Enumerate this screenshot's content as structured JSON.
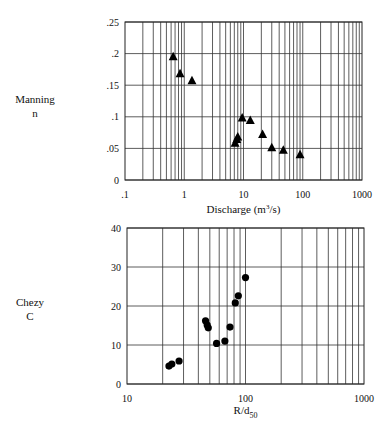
{
  "chart_data": [
    {
      "type": "scatter",
      "title": "",
      "ylabel": "Manning n",
      "ylabel_lines": [
        "Manning",
        "n"
      ],
      "xlabel": "Discharge (m³/s)",
      "xlabel_main": "Discharge (m",
      "xlabel_sup": "3",
      "xlabel_tail": "/s)",
      "xscale": "log",
      "xlim": [
        0.1,
        1000
      ],
      "ylim": [
        0,
        0.25
      ],
      "xticks": [
        ".1",
        "1",
        "10",
        "100",
        "1000"
      ],
      "xtick_values": [
        0.1,
        1,
        10,
        100,
        1000
      ],
      "yticks": [
        "0",
        ".05",
        ".1",
        ".15",
        ".2",
        ".25"
      ],
      "ytick_values": [
        0,
        0.05,
        0.1,
        0.15,
        0.2,
        0.25
      ],
      "grid": true,
      "marker": "triangle",
      "points": [
        {
          "x": 0.65,
          "y": 0.195
        },
        {
          "x": 0.85,
          "y": 0.168
        },
        {
          "x": 1.35,
          "y": 0.157
        },
        {
          "x": 7.2,
          "y": 0.058
        },
        {
          "x": 7.7,
          "y": 0.064
        },
        {
          "x": 8.0,
          "y": 0.068
        },
        {
          "x": 9.5,
          "y": 0.098
        },
        {
          "x": 13,
          "y": 0.094
        },
        {
          "x": 21,
          "y": 0.072
        },
        {
          "x": 30,
          "y": 0.051
        },
        {
          "x": 47,
          "y": 0.047
        },
        {
          "x": 90,
          "y": 0.04
        }
      ]
    },
    {
      "type": "scatter",
      "title": "",
      "ylabel": "Chezy C",
      "ylabel_lines": [
        "Chezy",
        "C"
      ],
      "xlabel": "R/d50",
      "xlabel_main": "R/d",
      "xlabel_sub": "50",
      "xscale": "log",
      "xlim": [
        10,
        1000
      ],
      "ylim": [
        0,
        40
      ],
      "xticks": [
        "10",
        "100",
        "1000"
      ],
      "xtick_values": [
        10,
        100,
        1000
      ],
      "yticks": [
        "0",
        "10",
        "20",
        "30",
        "40"
      ],
      "ytick_values": [
        0,
        10,
        20,
        30,
        40
      ],
      "grid": true,
      "marker": "circle",
      "points": [
        {
          "x": 22.6,
          "y": 4.6
        },
        {
          "x": 23.9,
          "y": 5.1
        },
        {
          "x": 27.5,
          "y": 5.9
        },
        {
          "x": 46,
          "y": 16.2
        },
        {
          "x": 47.5,
          "y": 15.1
        },
        {
          "x": 48.5,
          "y": 14.4
        },
        {
          "x": 57,
          "y": 10.4
        },
        {
          "x": 67,
          "y": 11.0
        },
        {
          "x": 74,
          "y": 14.6
        },
        {
          "x": 82,
          "y": 20.8
        },
        {
          "x": 87,
          "y": 22.6
        },
        {
          "x": 100,
          "y": 27.3
        }
      ]
    }
  ]
}
